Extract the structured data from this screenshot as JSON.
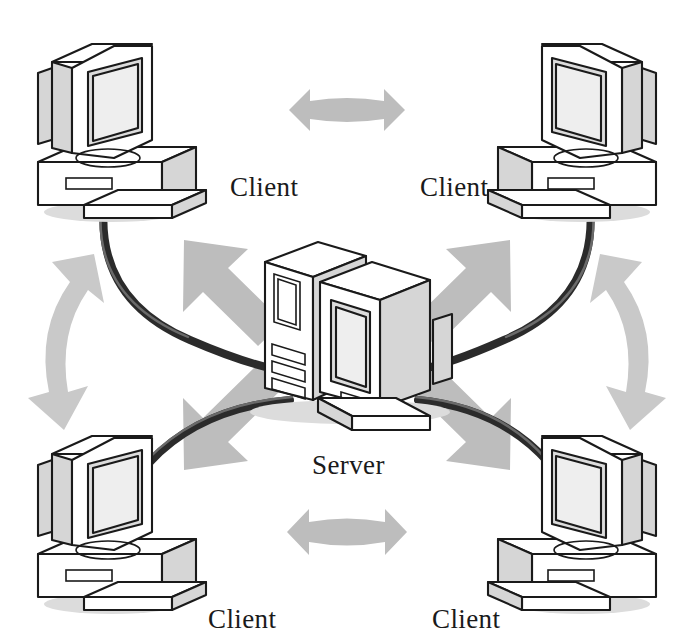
{
  "diagram": {
    "canvas": {
      "width": 694,
      "height": 642,
      "background": "#ffffff"
    },
    "style": {
      "arrow_color": "#bdbdbd",
      "cable_color": "#2b2b2b",
      "outline_color": "#1a1a1a",
      "shaded_face_color": "#d6d6d6",
      "screen_color": "#dcdcdc",
      "label_color": "#1a1a1a"
    },
    "nodes": [
      {
        "id": "client-top-left",
        "role": "client",
        "label": "Client",
        "icon": "desktop-computer-icon",
        "label_x": 230,
        "label_y": 196
      },
      {
        "id": "client-top-right",
        "role": "client",
        "label": "Client",
        "icon": "desktop-computer-icon",
        "label_x": 420,
        "label_y": 196
      },
      {
        "id": "server-center",
        "role": "server",
        "label": "Server",
        "icon": "tower-server-icon",
        "label_x": 312,
        "label_y": 474
      },
      {
        "id": "client-bottom-left",
        "role": "client",
        "label": "Client",
        "icon": "desktop-computer-icon",
        "label_x": 208,
        "label_y": 628
      },
      {
        "id": "client-bottom-right",
        "role": "client",
        "label": "Client",
        "icon": "desktop-computer-icon",
        "label_x": 432,
        "label_y": 628
      }
    ],
    "connections": [
      {
        "id": "cable-top-left",
        "from": "client-top-left",
        "to": "server-center",
        "type": "network-cable"
      },
      {
        "id": "cable-top-right",
        "from": "client-top-right",
        "to": "server-center",
        "type": "network-cable"
      },
      {
        "id": "cable-bottom-left",
        "from": "client-bottom-left",
        "to": "server-center",
        "type": "network-cable"
      },
      {
        "id": "cable-bottom-right",
        "from": "client-bottom-right",
        "to": "server-center",
        "type": "network-cable"
      }
    ],
    "flow_arrows": [
      {
        "id": "arrow-top-horizontal",
        "kind": "double-headed",
        "orientation": "horizontal",
        "between": [
          "client-top-left",
          "client-top-right"
        ]
      },
      {
        "id": "arrow-bottom-horizontal",
        "kind": "double-headed",
        "orientation": "horizontal",
        "between": [
          "client-bottom-left",
          "client-bottom-right"
        ]
      },
      {
        "id": "arrow-left-curved",
        "kind": "double-headed",
        "orientation": "vertical-curved",
        "between": [
          "client-top-left",
          "client-bottom-left"
        ]
      },
      {
        "id": "arrow-right-curved",
        "kind": "double-headed",
        "orientation": "vertical-curved",
        "between": [
          "client-top-right",
          "client-bottom-right"
        ]
      },
      {
        "id": "arrow-server-to-top-left",
        "kind": "single-headed",
        "orientation": "diagonal-up-left",
        "between": [
          "server-center",
          "client-top-left"
        ]
      },
      {
        "id": "arrow-server-to-top-right",
        "kind": "single-headed",
        "orientation": "diagonal-up-right",
        "between": [
          "server-center",
          "client-top-right"
        ]
      },
      {
        "id": "arrow-server-to-bottom-left",
        "kind": "single-headed",
        "orientation": "diagonal-down-left",
        "between": [
          "server-center",
          "client-bottom-left"
        ]
      },
      {
        "id": "arrow-server-to-bottom-right",
        "kind": "single-headed",
        "orientation": "diagonal-down-right",
        "between": [
          "server-center",
          "client-bottom-right"
        ]
      }
    ]
  }
}
